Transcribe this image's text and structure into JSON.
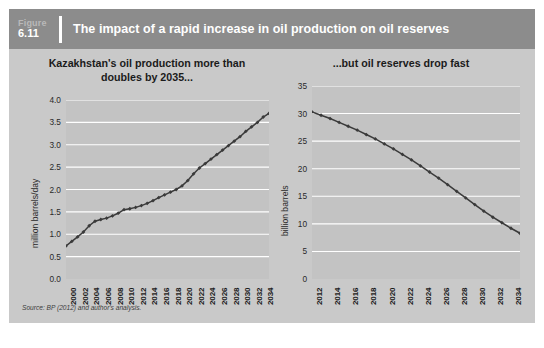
{
  "header": {
    "figure_word": "Figure",
    "figure_number": "6.11",
    "title": "The impact of a rapid increase in oil production on oil reserves",
    "bar_color": "#8c8c8c",
    "title_color": "#ffffff"
  },
  "card": {
    "background_color": "#c9c9c9",
    "plot_background_color": "#c3c3c3",
    "gridline_color": "#ffffff",
    "series_color": "#3a3a3a"
  },
  "source": "Source: BP (2012) and author's analysis.",
  "chart_data": [
    {
      "id": "left",
      "type": "line",
      "title": "Kazakhstan's oil production more than doubles by 2035...",
      "title_line1": "Kazakhstan's oil production more than",
      "title_line2": "doubles by 2035...",
      "xlabel": "",
      "ylabel": "million barrels/day",
      "ylim": [
        0.0,
        4.0
      ],
      "yticks": [
        "0.0",
        "0.5",
        "1.0",
        "1.5",
        "2.0",
        "2.5",
        "3.0",
        "3.5",
        "4.0"
      ],
      "ytick_values": [
        0.0,
        0.5,
        1.0,
        1.5,
        2.0,
        2.5,
        3.0,
        3.5,
        4.0
      ],
      "grid": true,
      "legend": "none",
      "xlim": [
        2000,
        2035
      ],
      "xticks": [
        "2000",
        "2002",
        "2004",
        "2006",
        "2008",
        "2010",
        "2012",
        "2014",
        "2016",
        "2018",
        "2020",
        "2022",
        "2024",
        "2026",
        "2028",
        "2030",
        "2032",
        "2034"
      ],
      "marker": "diamond",
      "x": [
        2000,
        2001,
        2002,
        2003,
        2004,
        2005,
        2006,
        2007,
        2008,
        2009,
        2010,
        2011,
        2012,
        2013,
        2014,
        2015,
        2016,
        2017,
        2018,
        2019,
        2020,
        2021,
        2022,
        2023,
        2024,
        2025,
        2026,
        2027,
        2028,
        2029,
        2030,
        2031,
        2032,
        2033,
        2034,
        2035
      ],
      "values": [
        0.74,
        0.84,
        0.94,
        1.05,
        1.19,
        1.29,
        1.33,
        1.36,
        1.41,
        1.47,
        1.55,
        1.57,
        1.6,
        1.64,
        1.69,
        1.75,
        1.82,
        1.88,
        1.94,
        2.0,
        2.08,
        2.2,
        2.35,
        2.48,
        2.58,
        2.68,
        2.78,
        2.88,
        2.98,
        3.08,
        3.18,
        3.3,
        3.4,
        3.5,
        3.62,
        3.7
      ]
    },
    {
      "id": "right",
      "type": "line",
      "title": "...but oil reserves drop fast",
      "xlabel": "",
      "ylabel": "billion barrels",
      "ylim": [
        0,
        35
      ],
      "yticks": [
        "0",
        "5",
        "10",
        "15",
        "20",
        "25",
        "30",
        "35"
      ],
      "ytick_values": [
        0,
        5,
        10,
        15,
        20,
        25,
        30,
        35
      ],
      "grid": true,
      "legend": "none",
      "xlim": [
        2012,
        2035
      ],
      "xticks": [
        "2012",
        "2014",
        "2016",
        "2018",
        "2020",
        "2022",
        "2024",
        "2026",
        "2028",
        "2030",
        "2032",
        "2034"
      ],
      "marker": "diamond",
      "x": [
        2012,
        2013,
        2014,
        2015,
        2016,
        2017,
        2018,
        2019,
        2020,
        2021,
        2022,
        2023,
        2024,
        2025,
        2026,
        2027,
        2028,
        2029,
        2030,
        2031,
        2032,
        2033,
        2034,
        2035
      ],
      "values": [
        30.3,
        29.7,
        29.1,
        28.4,
        27.7,
        27.0,
        26.2,
        25.4,
        24.5,
        23.6,
        22.6,
        21.6,
        20.5,
        19.4,
        18.3,
        17.1,
        15.9,
        14.7,
        13.5,
        12.3,
        11.2,
        10.2,
        9.2,
        8.3
      ]
    }
  ]
}
